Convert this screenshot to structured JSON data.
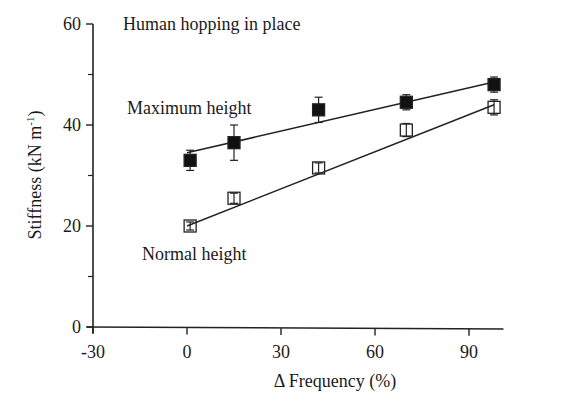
{
  "chart_data": {
    "type": "scatter",
    "title": "Human hopping in place",
    "xlabel": "Δ Frequency (%)",
    "ylabel": "Stiffness (kN m-1)",
    "ylabel_main": "Stiffness (kN m",
    "ylabel_sup": "-1",
    "ylabel_close": ")",
    "xlim": [
      -30,
      100
    ],
    "ylim": [
      0,
      60
    ],
    "xticks": [
      -30,
      0,
      30,
      60,
      90
    ],
    "xtick_labels": [
      "-30",
      "0",
      "30",
      "60",
      "90"
    ],
    "yticks": [
      0,
      20,
      40,
      60
    ],
    "ytick_labels": [
      "0",
      "20",
      "40",
      "60"
    ],
    "yminor_ticks": [
      10,
      30,
      50
    ],
    "grid": false,
    "legend": "inline annotations",
    "series": [
      {
        "name": "Maximum height",
        "marker": "filled-square",
        "color": "#111111",
        "x": [
          1,
          15,
          42,
          70,
          98
        ],
        "y": [
          33,
          36.5,
          43,
          44.5,
          48
        ],
        "yerr": [
          2,
          3.5,
          2.5,
          1.5,
          1.5
        ],
        "fit": {
          "x": [
            0,
            98
          ],
          "y": [
            34.5,
            48.5
          ]
        }
      },
      {
        "name": "Normal height",
        "marker": "open-square",
        "color": "#111111",
        "x": [
          1,
          15,
          42,
          70,
          98
        ],
        "y": [
          20,
          25.5,
          31.5,
          39,
          43.5
        ],
        "yerr": [
          0.8,
          1,
          1,
          1.3,
          1.5
        ],
        "fit": {
          "x": [
            0,
            98
          ],
          "y": [
            20,
            44
          ]
        }
      }
    ],
    "annotations": [
      {
        "text": "Human hopping in place",
        "x": -20,
        "y": 60
      },
      {
        "text": "Maximum height",
        "x": -22,
        "y": 49
      },
      {
        "text": "Normal height",
        "x": 4,
        "y": 14.5
      }
    ]
  }
}
